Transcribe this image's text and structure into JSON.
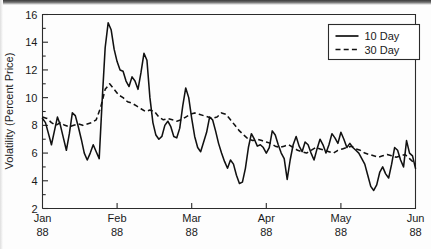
{
  "chart_data": {
    "type": "line",
    "title": "",
    "xlabel": "",
    "ylabel": "Volatility (Percent Price)",
    "ylim": [
      2,
      16
    ],
    "yticks": [
      2,
      4,
      6,
      8,
      10,
      12,
      14,
      16
    ],
    "ytick_labels": [
      "2",
      "4",
      "6",
      "8",
      "10",
      "12",
      "14",
      "16"
    ],
    "yminor_step": 1,
    "xlim": [
      0,
      5
    ],
    "xticks": [
      0,
      1,
      2,
      3,
      4,
      5
    ],
    "xtick_labels": [
      "Jan",
      "Feb",
      "Mar",
      "Apr",
      "May",
      "Jun"
    ],
    "xtick_sublabels": [
      "88",
      "88",
      "88",
      "88",
      "88",
      "88"
    ],
    "grid": false,
    "legend_position": "top-right",
    "series": [
      {
        "name": "10 Day",
        "style": "solid",
        "color": "#111111",
        "x": [
          0.0,
          0.04,
          0.08,
          0.12,
          0.16,
          0.2,
          0.24,
          0.28,
          0.32,
          0.36,
          0.4,
          0.44,
          0.48,
          0.52,
          0.56,
          0.6,
          0.64,
          0.68,
          0.72,
          0.76,
          0.8,
          0.84,
          0.88,
          0.92,
          0.96,
          1.0,
          1.04,
          1.08,
          1.12,
          1.16,
          1.2,
          1.24,
          1.28,
          1.32,
          1.36,
          1.4,
          1.44,
          1.48,
          1.52,
          1.56,
          1.6,
          1.64,
          1.68,
          1.72,
          1.76,
          1.8,
          1.84,
          1.88,
          1.92,
          1.96,
          2.0,
          2.04,
          2.08,
          2.12,
          2.16,
          2.2,
          2.24,
          2.28,
          2.32,
          2.36,
          2.4,
          2.44,
          2.48,
          2.52,
          2.56,
          2.6,
          2.64,
          2.68,
          2.72,
          2.76,
          2.8,
          2.84,
          2.88,
          2.92,
          2.96,
          3.0,
          3.04,
          3.08,
          3.12,
          3.16,
          3.2,
          3.24,
          3.28,
          3.32,
          3.36,
          3.4,
          3.44,
          3.48,
          3.52,
          3.56,
          3.6,
          3.64,
          3.68,
          3.72,
          3.76,
          3.8,
          3.84,
          3.88,
          3.92,
          3.96,
          4.0,
          4.04,
          4.08,
          4.12,
          4.16,
          4.2,
          4.24,
          4.28,
          4.32,
          4.36,
          4.4,
          4.44,
          4.48,
          4.52,
          4.56,
          4.6,
          4.64,
          4.68,
          4.72,
          4.76,
          4.8,
          4.84,
          4.88,
          4.92,
          4.96,
          5.0
        ],
        "y": [
          8.5,
          8.2,
          7.4,
          6.6,
          7.6,
          8.6,
          8.0,
          7.1,
          6.2,
          7.4,
          8.9,
          8.7,
          7.9,
          7.0,
          6.0,
          5.5,
          6.0,
          6.6,
          6.1,
          5.6,
          9.8,
          13.6,
          15.4,
          14.9,
          13.5,
          12.6,
          12.0,
          11.9,
          11.2,
          10.8,
          11.5,
          11.2,
          10.6,
          11.8,
          13.2,
          12.7,
          10.0,
          8.2,
          7.3,
          7.0,
          7.2,
          8.0,
          8.3,
          7.9,
          7.2,
          7.1,
          7.8,
          9.4,
          10.7,
          10.0,
          8.5,
          7.2,
          6.4,
          6.1,
          6.8,
          7.5,
          8.6,
          8.4,
          7.6,
          6.7,
          6.0,
          5.4,
          4.9,
          5.5,
          5.2,
          4.4,
          3.8,
          3.9,
          4.9,
          6.4,
          7.4,
          7.0,
          6.5,
          6.6,
          6.4,
          6.0,
          6.4,
          7.6,
          7.3,
          6.6,
          6.0,
          5.6,
          4.1,
          5.5,
          6.6,
          7.2,
          6.5,
          6.1,
          6.8,
          6.6,
          6.0,
          5.5,
          6.3,
          7.0,
          6.6,
          6.0,
          6.6,
          7.4,
          7.1,
          6.7,
          7.5,
          7.0,
          6.4,
          6.7,
          6.4,
          6.2,
          6.0,
          5.6,
          5.2,
          4.4,
          3.6,
          3.3,
          3.7,
          4.6,
          5.0,
          4.5,
          4.2,
          5.2,
          6.4,
          6.2,
          5.5,
          5.0,
          6.9,
          6.0,
          5.8,
          4.9
        ]
      },
      {
        "name": "30 Day",
        "style": "dashed",
        "color": "#111111",
        "x": [
          0.0,
          0.06,
          0.12,
          0.18,
          0.24,
          0.3,
          0.36,
          0.42,
          0.48,
          0.54,
          0.6,
          0.66,
          0.72,
          0.78,
          0.84,
          0.9,
          0.96,
          1.02,
          1.08,
          1.14,
          1.2,
          1.26,
          1.32,
          1.38,
          1.44,
          1.5,
          1.56,
          1.62,
          1.68,
          1.74,
          1.8,
          1.86,
          1.92,
          1.98,
          2.04,
          2.1,
          2.16,
          2.22,
          2.28,
          2.34,
          2.4,
          2.46,
          2.52,
          2.58,
          2.64,
          2.7,
          2.76,
          2.82,
          2.88,
          2.94,
          3.0,
          3.06,
          3.12,
          3.18,
          3.24,
          3.3,
          3.36,
          3.42,
          3.48,
          3.54,
          3.6,
          3.66,
          3.72,
          3.78,
          3.84,
          3.9,
          3.96,
          4.02,
          4.08,
          4.14,
          4.2,
          4.26,
          4.32,
          4.38,
          4.44,
          4.5,
          4.56,
          4.62,
          4.68,
          4.74,
          4.8,
          4.86,
          4.92,
          5.0
        ],
        "y": [
          8.6,
          8.5,
          8.2,
          8.0,
          8.2,
          8.0,
          7.9,
          8.0,
          8.1,
          8.0,
          8.1,
          8.2,
          8.4,
          9.3,
          10.6,
          11.0,
          10.6,
          10.2,
          10.0,
          9.7,
          9.6,
          9.4,
          9.2,
          9.0,
          9.1,
          9.0,
          8.6,
          8.4,
          8.5,
          8.4,
          8.3,
          8.4,
          8.6,
          8.8,
          8.9,
          8.8,
          8.7,
          8.6,
          8.5,
          8.6,
          8.9,
          8.8,
          8.4,
          8.0,
          7.6,
          7.3,
          7.0,
          6.9,
          7.0,
          6.9,
          6.8,
          6.7,
          6.5,
          6.4,
          6.5,
          6.6,
          6.4,
          6.2,
          6.1,
          6.0,
          6.2,
          6.4,
          6.3,
          6.2,
          6.1,
          6.0,
          6.2,
          6.3,
          6.4,
          6.5,
          6.3,
          6.2,
          6.0,
          5.9,
          5.8,
          5.7,
          5.8,
          5.9,
          5.8,
          5.7,
          5.8,
          5.9,
          5.6,
          5.2
        ]
      }
    ],
    "legend": [
      {
        "label": "10 Day",
        "style": "solid"
      },
      {
        "label": "30 Day",
        "style": "dashed"
      }
    ]
  }
}
